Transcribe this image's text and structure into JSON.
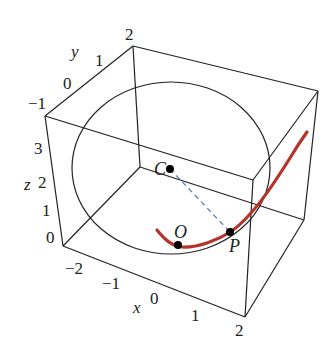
{
  "figure": {
    "type": "3d-box-plot",
    "colors": {
      "box": "#222222",
      "sphere": "#222222",
      "curve": "#b5332a",
      "segment": "#5b7fb8",
      "points": "#000000"
    }
  },
  "axes": {
    "x": {
      "label": "x",
      "ticks": [
        "−2",
        "−1",
        "0",
        "1",
        "2"
      ]
    },
    "y": {
      "label": "y",
      "ticks": [
        "−1",
        "0",
        "1",
        "2"
      ]
    },
    "z": {
      "label": "z",
      "ticks": [
        "0",
        "1",
        "2",
        "3"
      ]
    }
  },
  "points": {
    "C": {
      "label": "C"
    },
    "O": {
      "label": "O"
    },
    "P": {
      "label": "P"
    }
  }
}
